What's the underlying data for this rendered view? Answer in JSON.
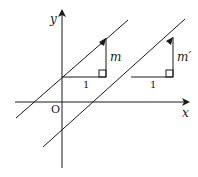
{
  "diagram": {
    "axes": {
      "x_label": "x",
      "y_label": "y",
      "origin_label": "O"
    },
    "triangles": [
      {
        "run_label": "1",
        "rise_label": "m"
      },
      {
        "run_label": "1",
        "rise_label": "m′"
      }
    ],
    "colors": {
      "stroke": "#1a1a1a",
      "background": "#ffffff"
    }
  }
}
